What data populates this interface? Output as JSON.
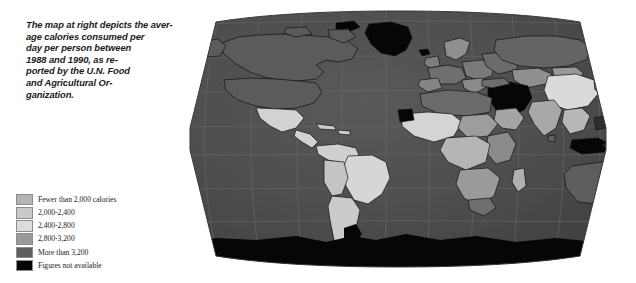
{
  "caption": {
    "lines": [
      "The map at right depicts the aver-",
      "age calories consumed per",
      "day per person between",
      "1988 and 1990, as re-",
      "ported by the U.N. Food",
      "and Agricultural Or-",
      "ganization."
    ],
    "full_text": "The map at right depicts the average calories consumed per day per person between 1988 and 1990, as reported by the U.N. Food and Agricultural Organization."
  },
  "legend": {
    "title": "",
    "entries": [
      {
        "label": "Fewer than 2,000 calories",
        "color": "#b4b4b4",
        "swatch_name": "legend-swatch-fewer-than-2000"
      },
      {
        "label": "2,000-2,400",
        "color": "#c9c9c9",
        "swatch_name": "legend-swatch-2000-2400"
      },
      {
        "label": "2,400-2,800",
        "color": "#dcdcdc",
        "swatch_name": "legend-swatch-2400-2800"
      },
      {
        "label": "2,800-3,200",
        "color": "#9a9a9a",
        "swatch_name": "legend-swatch-2800-3200"
      },
      {
        "label": "More than 3,200",
        "color": "#5e5e5e",
        "swatch_name": "legend-swatch-more-than-3200"
      },
      {
        "label": "Figures not available",
        "color": "#050505",
        "swatch_name": "legend-swatch-not-available"
      }
    ]
  },
  "map": {
    "projection": "robinson-globe",
    "ocean_color": "#4f4f4f",
    "graticule_color": "#636363",
    "border_color": "#141414",
    "background": "#ffffff",
    "alt": "World map shaded by average daily calories consumed per person, 1988-1990"
  },
  "colors": {
    "page_background": "#ffffff",
    "text": "#1b1b1b"
  }
}
